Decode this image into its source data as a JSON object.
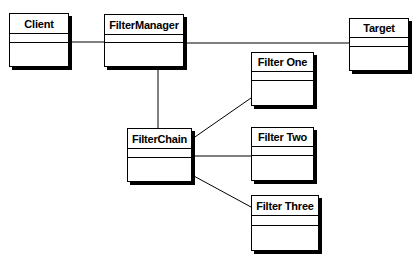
{
  "diagram": {
    "type": "uml-class-diagram",
    "classes": [
      {
        "id": "client",
        "name": "Client",
        "x": 9,
        "y": 13,
        "w": 60,
        "h": 54,
        "nameH": 20,
        "attrH": 9
      },
      {
        "id": "filtermanager",
        "name": "FilterManager",
        "x": 104,
        "y": 14,
        "w": 80,
        "h": 53,
        "nameH": 20,
        "attrH": 8
      },
      {
        "id": "target",
        "name": "Target",
        "x": 349,
        "y": 18,
        "w": 60,
        "h": 53,
        "nameH": 19,
        "attrH": 9
      },
      {
        "id": "filterone",
        "name": "Filter One",
        "x": 251,
        "y": 52,
        "w": 63,
        "h": 54,
        "nameH": 19,
        "attrH": 9
      },
      {
        "id": "filterchain",
        "name": "FilterChain",
        "x": 127,
        "y": 128,
        "w": 65,
        "h": 54,
        "nameH": 20,
        "attrH": 9
      },
      {
        "id": "filtertwo",
        "name": "Filter Two",
        "x": 251,
        "y": 127,
        "w": 63,
        "h": 54,
        "nameH": 19,
        "attrH": 9
      },
      {
        "id": "filterthree",
        "name": "Filter Three",
        "x": 251,
        "y": 195,
        "w": 68,
        "h": 56,
        "nameH": 20,
        "attrH": 10
      }
    ],
    "associations": [
      {
        "from": "client",
        "to": "filtermanager",
        "x1": 69,
        "y1": 42,
        "x2": 104,
        "y2": 42
      },
      {
        "from": "filtermanager",
        "to": "target",
        "x1": 184,
        "y1": 43,
        "x2": 349,
        "y2": 43
      },
      {
        "from": "filtermanager",
        "to": "filterchain",
        "x1": 158,
        "y1": 67,
        "x2": 158,
        "y2": 128
      },
      {
        "from": "filterchain",
        "to": "filterone",
        "x1": 192,
        "y1": 139,
        "x2": 251,
        "y2": 98
      },
      {
        "from": "filterchain",
        "to": "filtertwo",
        "x1": 192,
        "y1": 156,
        "x2": 251,
        "y2": 156
      },
      {
        "from": "filterchain",
        "to": "filterthree",
        "x1": 192,
        "y1": 175,
        "x2": 251,
        "y2": 207
      }
    ],
    "colors": {
      "line": "#000000",
      "box_fill": "#ffffff",
      "shadow": "#000000",
      "background": "#ffffff"
    }
  }
}
